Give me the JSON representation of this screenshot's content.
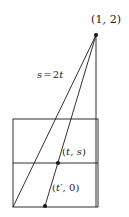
{
  "figure": {
    "kind": "geometry-diagram",
    "background_color": "#ffffff",
    "stroke_color": "#1a1a1a",
    "labels": {
      "apex_point": "(1, 2)",
      "slope_line": "s = 2t",
      "mid_point": "(t, s)",
      "base_point": "(t′, 0)"
    },
    "label_parts": {
      "apex_open": "(",
      "apex_x": "1",
      "apex_sep": ", ",
      "apex_y": "2",
      "apex_close": ")",
      "slope_lhs": "s",
      "slope_eq": "=",
      "slope_rhs_coef": "2",
      "slope_rhs_var": "t",
      "mid_open": "(",
      "mid_x": "t",
      "mid_sep": ", ",
      "mid_y": "s",
      "mid_close": ")",
      "base_open": "(",
      "base_x": "t′",
      "base_sep": ", ",
      "base_y": "0",
      "base_close": ")"
    },
    "geometry": {
      "rect": {
        "x": 13,
        "y": 119,
        "width": 85,
        "height": 88
      },
      "divider_y": 163,
      "apex": {
        "x": 96,
        "y": 35
      },
      "point_ts": {
        "x": 58,
        "y": 163
      },
      "point_t0": {
        "x": 45,
        "y": 206
      },
      "rect_bottom_left": {
        "x": 13,
        "y": 207
      },
      "line_a": {
        "x1": 13,
        "y1": 207,
        "x2": 96,
        "y2": 35
      },
      "line_b": {
        "x1": 45,
        "y1": 206,
        "x2": 96,
        "y2": 35
      },
      "vertical_edge": {
        "x": 96,
        "y1": 35,
        "y2": 207
      },
      "dot_radius": 2.1,
      "stroke_width": 0.9
    }
  }
}
